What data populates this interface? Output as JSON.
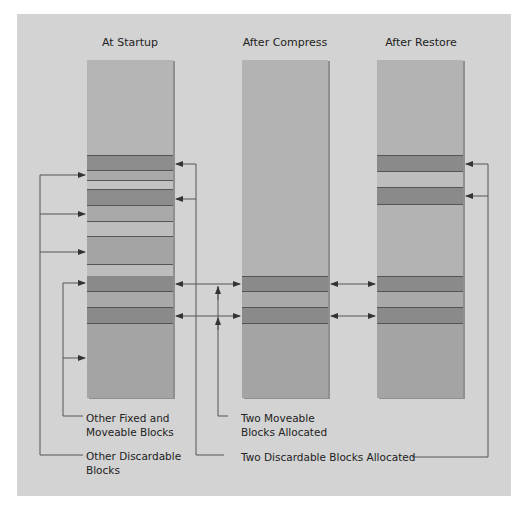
{
  "titles": {
    "startup": "At Startup",
    "compress": "After Compress",
    "restore": "After Restore"
  },
  "labels": {
    "fixed_moveable_line1": "Other Fixed and",
    "fixed_moveable_line2": "Moveable Blocks",
    "discardable_line1": "Other Discardable",
    "discardable_line2": "Blocks",
    "two_moveable_line1": "Two Moveable",
    "two_moveable_line2": "Blocks Allocated",
    "two_discardable": "Two Discardable Blocks Allocated"
  },
  "colors": {
    "panel": "#d3d3d3",
    "free": "#b3b3b3",
    "light_block": "#bdbdbd",
    "mid_block": "#a8a8a8",
    "dark_block": "#8a8a8a",
    "line": "#444444"
  }
}
